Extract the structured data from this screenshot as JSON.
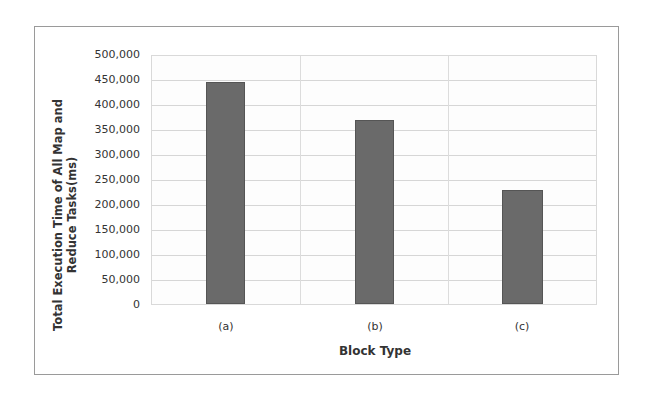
{
  "chart_data": {
    "type": "bar",
    "title": "",
    "xlabel": "Block Type",
    "ylabel": "Total Execution Time of All Map and Reduce Tasks(ms)",
    "ylabel_lines": [
      "Total Execution Time of All Map and",
      "Reduce Tasks(ms)"
    ],
    "categories": [
      "(a)",
      "(b)",
      "(c)"
    ],
    "values": [
      448000,
      370000,
      229000
    ],
    "ylim": [
      0,
      500000
    ],
    "yticks": [
      0,
      50000,
      100000,
      150000,
      200000,
      250000,
      300000,
      350000,
      400000,
      450000,
      500000
    ],
    "ytick_labels": [
      "0",
      "50,000",
      "100,000",
      "150,000",
      "200,000",
      "250,000",
      "300,000",
      "350,000",
      "400,000",
      "450,000",
      "500,000"
    ],
    "grid": true,
    "legend": null,
    "bar_color": "#6a6a6a"
  }
}
